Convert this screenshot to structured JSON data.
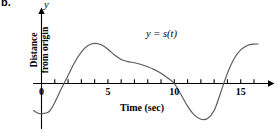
{
  "figure": {
    "part_label": "b.",
    "y_axis_letter": "y",
    "equation_label": "y = s(t)",
    "ylabel_line1": "Distance",
    "ylabel_line2": "from origin",
    "xlabel": "Time (sec)",
    "curve_color": "#595959",
    "axis_color": "#000000"
  },
  "chart_data": {
    "type": "line",
    "title": "",
    "subtitle": "",
    "xlabel": "Time (sec)",
    "ylabel": "Distance from origin",
    "annotations": [
      "y = s(t)",
      "b."
    ],
    "legend": [],
    "legend_position": "none",
    "grid": false,
    "xlim": [
      -1,
      17
    ],
    "ylim": [
      -2.6,
      3.2
    ],
    "x_ticks": [
      1,
      2,
      3,
      4,
      5,
      6,
      7,
      8,
      9,
      10,
      11,
      12,
      13,
      14,
      15,
      16
    ],
    "x_tick_labels": [
      "0",
      "5",
      "10",
      "15"
    ],
    "x_tick_label_values": [
      0,
      5,
      10,
      15
    ],
    "y_ticks": [],
    "y_tick_labels": [],
    "series": [
      {
        "name": "y = s(t)",
        "x": [
          -0.6,
          -0.2,
          0.2,
          0.6,
          1.0,
          1.5,
          2.0,
          2.5,
          3.0,
          3.5,
          4.0,
          4.5,
          5.0,
          5.5,
          6.0,
          6.5,
          7.0,
          7.5,
          8.0,
          8.5,
          9.0,
          9.5,
          10.0,
          10.5,
          11.0,
          11.5,
          12.0,
          12.5,
          13.0,
          13.5,
          14.0,
          14.5,
          15.0,
          15.5,
          16.0,
          16.3
        ],
        "y": [
          -1.85,
          -2.05,
          -2.05,
          -1.9,
          -1.3,
          -0.35,
          0.55,
          1.45,
          2.15,
          2.6,
          2.75,
          2.65,
          2.35,
          1.95,
          1.65,
          1.5,
          1.42,
          1.3,
          1.15,
          0.95,
          0.7,
          0.38,
          0.0,
          -0.75,
          -1.55,
          -2.15,
          -2.45,
          -2.4,
          -1.85,
          -0.6,
          0.7,
          1.7,
          2.3,
          2.6,
          2.7,
          2.7
        ]
      }
    ],
    "zero_crossings": [
      1.65,
      10.0,
      13.65
    ],
    "local_maxima": [
      {
        "x": 4.0,
        "y": 2.75
      },
      {
        "x": 16.0,
        "y": 2.7
      }
    ],
    "local_minima": [
      {
        "x": 0.3,
        "y": -2.05
      },
      {
        "x": 12.1,
        "y": -2.45
      }
    ],
    "inflection_plateau": {
      "x": 6.8,
      "y": 1.42
    }
  }
}
